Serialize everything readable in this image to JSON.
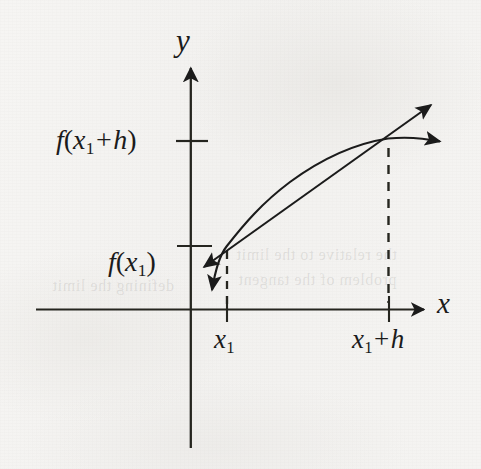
{
  "figure": {
    "kind": "math-diagram",
    "background_color": "#f4f3f1",
    "ink_color": "#1b1b1b"
  },
  "axes": {
    "x_axis_label": "x",
    "y_axis_label": "y",
    "x_axis": {
      "y_px": 309,
      "x_start_px": 36,
      "x_end_px": 428
    },
    "y_axis": {
      "x_px": 191,
      "y_top_px": 63,
      "y_bottom_px": 449
    }
  },
  "value_labels": {
    "f_of_x1_plus_h": "f(x₁ + h)",
    "f_of_x1": "f(x₁)",
    "x1": "x₁",
    "x1_plus_h": "x₁ + h"
  },
  "parts": {
    "f_name": "f",
    "x_var": "x",
    "h_var": "h",
    "y_var": "y",
    "subscript_one": "1",
    "plus": "+",
    "paren_open": "(",
    "paren_close": ")"
  },
  "y_ticks": [
    {
      "name": "f(x1+h)",
      "value_label": "f(x₁ + h)",
      "y_px": 141
    },
    {
      "name": "f(x1)",
      "value_label": "f(x₁)",
      "y_px": 246
    }
  ],
  "x_ticks": [
    {
      "name": "x1",
      "value_label": "x₁",
      "x_px": 227
    },
    {
      "name": "x1+h",
      "value_label": "x₁ + h",
      "x_px": 389
    }
  ],
  "points": [
    {
      "name": "point-x1",
      "x_px": 226,
      "y_px": 246
    },
    {
      "name": "point-x1-plus-h",
      "x_px": 388,
      "y_px": 138
    }
  ],
  "curves": {
    "function_curve": {
      "name": "function-curve",
      "path": "M 212 289 C 216 266 220 254 226 246 C 250 214 268 191 300 170 C 334 148 362 141 388 138 C 408 137 426 139 441 142",
      "arrow_end": "right",
      "arrow_start": "down"
    },
    "secant_line": {
      "name": "secant-line",
      "from_px": [
        203,
        268
      ],
      "to_px": [
        432,
        104
      ],
      "arrow_start": "down-left",
      "arrow_end": "up-right"
    }
  },
  "dashed_guides": [
    {
      "name": "dashed-x1",
      "x_px": 227,
      "y_top_px": 251,
      "y_bottom_px": 306
    },
    {
      "name": "dashed-x1-plus-h",
      "x_px": 388,
      "y_top_px": 148,
      "y_bottom_px": 303
    }
  ],
  "ghost_text": [
    {
      "text": "the relative to the limit",
      "x_px": 236,
      "y_px": 253
    },
    {
      "text": "defining the limit",
      "x_px": 52,
      "y_px": 284
    },
    {
      "text": "problem of the tangent",
      "x_px": 238,
      "y_px": 278
    }
  ]
}
